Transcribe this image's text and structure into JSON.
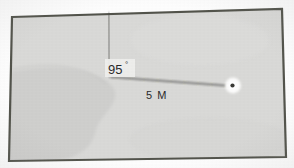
{
  "diagram": {
    "kind": "surveying-bearing-sketch",
    "frame": {
      "label": "map-boundary-frame",
      "border_color": "#53544c",
      "fill_color": "#d9d9d7",
      "outer_margin_color": "#fdfdfd"
    },
    "terrain": {
      "label": "shaded-landmass-region",
      "fill_color": "#cfcfcd"
    },
    "reference_line": {
      "label": "north-reference-line",
      "color": "#4a4a46"
    },
    "bearing_line": {
      "label": "bearing-traverse-line",
      "color": "#2f2f2c"
    },
    "station_marker": {
      "label": "station-point-marker",
      "fill_color": "#ffffff",
      "dot_color": "#3a3a36"
    },
    "angle_label": {
      "value": "95",
      "unit": "°",
      "text": "95°",
      "box_fill": "#efefed"
    },
    "distance_label": {
      "text": "5 M",
      "value": "5",
      "unit": "M"
    }
  }
}
